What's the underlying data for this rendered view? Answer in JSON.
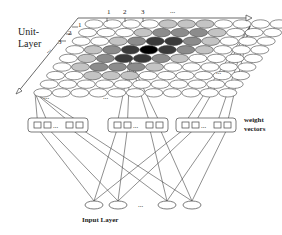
{
  "diagram": {
    "unit_layer_label_line1": "Unit-",
    "unit_layer_label_line2": "Layer",
    "weight_vectors_label_line1": "weight",
    "weight_vectors_label_line2": "vectors",
    "input_layer_label": "Input Layer",
    "top_axis_ticks": [
      "1",
      "2",
      "3",
      "..."
    ],
    "side_axis_ticks": [
      "1",
      "2",
      "3",
      "..."
    ],
    "ellipsis": "...",
    "grid": {
      "rows": 9,
      "cols": 11,
      "bmu_row": 3,
      "bmu_col": 4
    },
    "colors": {
      "line": "#444444",
      "cell_fill": "#ffffff",
      "level_1": "#000000",
      "level_2": "#3a3a3a",
      "level_3": "#8c8c8c",
      "level_4": "#c4c4c4"
    },
    "weight_vector_groups": 3,
    "input_nodes": 4
  }
}
